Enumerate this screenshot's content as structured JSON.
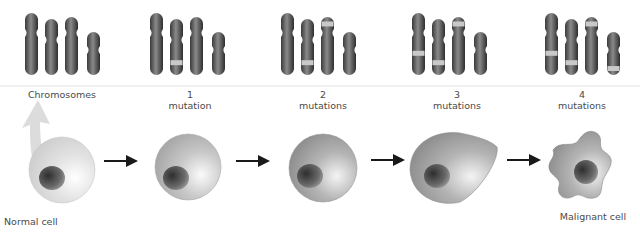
{
  "diagram": {
    "stages": [
      {
        "chromosome_label": "Chromosomes",
        "cell_label": "Normal cell",
        "mutations": 0,
        "bands": []
      },
      {
        "chromosome_label_num": "1",
        "chromosome_label_word": "mutation",
        "cell_label": "",
        "mutations": 1,
        "bands": [
          {
            "chrom": 1,
            "pos": 0.78
          }
        ]
      },
      {
        "chromosome_label_num": "2",
        "chromosome_label_word": "mutations",
        "cell_label": "",
        "mutations": 2,
        "bands": [
          {
            "chrom": 1,
            "pos": 0.78
          },
          {
            "chrom": 2,
            "pos": 0.12
          }
        ]
      },
      {
        "chromosome_label_num": "3",
        "chromosome_label_word": "mutations",
        "cell_label": "",
        "mutations": 3,
        "bands": [
          {
            "chrom": 0,
            "pos": 0.65
          },
          {
            "chrom": 1,
            "pos": 0.78
          },
          {
            "chrom": 2,
            "pos": 0.12
          }
        ]
      },
      {
        "chromosome_label_num": "4",
        "chromosome_label_word": "mutations",
        "cell_label": "Malignant cell",
        "mutations": 4,
        "bands": [
          {
            "chrom": 0,
            "pos": 0.65
          },
          {
            "chrom": 1,
            "pos": 0.78
          },
          {
            "chrom": 2,
            "pos": 0.12
          },
          {
            "chrom": 3,
            "pos": 0.85
          }
        ]
      }
    ],
    "colors": {
      "chromosome": "#5a5a5a",
      "band": "#c9c9c9",
      "cell_normal": "#dcdcdc",
      "cell_mid": "#bdbdbd",
      "cell_dark": "#9a9a9a",
      "nucleus": "#4a4a4a",
      "arrow": "#1a1a1a",
      "callout_arrow": "#d4d4d4",
      "text": "#4a4a4a"
    }
  }
}
